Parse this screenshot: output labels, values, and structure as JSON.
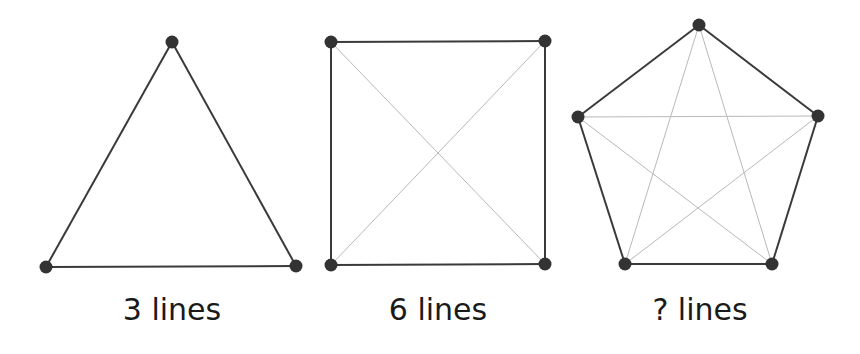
{
  "colors": {
    "edge": "#3a3a3a",
    "diagonal": "#b8b8b8",
    "vertex": "#333333",
    "text": "#1a1a1a"
  },
  "figures": [
    {
      "name": "triangle",
      "label": "3 lines",
      "label_x": 172,
      "vertices": [
        [
          172,
          42
        ],
        [
          296,
          266
        ],
        [
          46,
          267
        ]
      ],
      "outer_edges": [
        [
          0,
          1
        ],
        [
          1,
          2
        ],
        [
          2,
          0
        ]
      ],
      "diagonals": []
    },
    {
      "name": "square",
      "label": "6 lines",
      "label_x": 438,
      "vertices": [
        [
          331,
          42
        ],
        [
          545,
          41
        ],
        [
          545,
          264
        ],
        [
          331,
          265
        ]
      ],
      "outer_edges": [
        [
          0,
          1
        ],
        [
          1,
          2
        ],
        [
          2,
          3
        ],
        [
          3,
          0
        ]
      ],
      "diagonals": [
        [
          0,
          2
        ],
        [
          1,
          3
        ]
      ]
    },
    {
      "name": "pentagon",
      "label": "? lines",
      "label_x": 700,
      "vertices": [
        [
          699,
          25
        ],
        [
          818,
          116
        ],
        [
          772,
          264
        ],
        [
          625,
          264
        ],
        [
          578,
          117
        ]
      ],
      "outer_edges": [
        [
          0,
          1
        ],
        [
          1,
          2
        ],
        [
          2,
          3
        ],
        [
          3,
          4
        ],
        [
          4,
          0
        ]
      ],
      "diagonals": [
        [
          0,
          2
        ],
        [
          0,
          3
        ],
        [
          1,
          3
        ],
        [
          1,
          4
        ],
        [
          2,
          4
        ]
      ]
    }
  ]
}
